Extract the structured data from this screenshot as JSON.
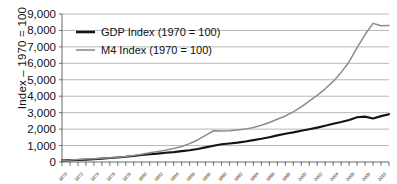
{
  "chart_data": {
    "type": "line",
    "title": "",
    "xlabel": "",
    "ylabel": "Index – 1970 = 100",
    "ylim": [
      0,
      9000
    ],
    "xlim": [
      1970,
      2011
    ],
    "grid": true,
    "legend_position": "top-left",
    "y_ticks": [
      "0",
      "1,000",
      "2,000",
      "3,000",
      "4,000",
      "5,000",
      "6,000",
      "7,000",
      "8,000",
      "9,000"
    ],
    "y_tick_values": [
      0,
      1000,
      2000,
      3000,
      4000,
      5000,
      6000,
      7000,
      8000,
      9000
    ],
    "x_ticks": [
      "1970",
      "1972",
      "1974",
      "1976",
      "1978",
      "1980",
      "1982",
      "1984",
      "1986",
      "1988",
      "1990",
      "1992",
      "1994",
      "1996",
      "1998",
      "2000",
      "2002",
      "2004",
      "2006",
      "2008",
      "2010"
    ],
    "x": [
      1970,
      1971,
      1972,
      1973,
      1974,
      1975,
      1976,
      1977,
      1978,
      1979,
      1980,
      1981,
      1982,
      1983,
      1984,
      1985,
      1986,
      1987,
      1988,
      1989,
      1990,
      1991,
      1992,
      1993,
      1994,
      1995,
      1996,
      1997,
      1998,
      1999,
      2000,
      2001,
      2002,
      2003,
      2004,
      2005,
      2006,
      2007,
      2008,
      2009,
      2010,
      2011
    ],
    "series": [
      {
        "name": "GDP Index (1970 = 100)",
        "color": "#141414",
        "values": [
          100,
          112,
          126,
          146,
          166,
          205,
          240,
          275,
          315,
          370,
          430,
          470,
          510,
          560,
          600,
          660,
          715,
          790,
          890,
          990,
          1080,
          1130,
          1180,
          1250,
          1330,
          1410,
          1510,
          1620,
          1720,
          1800,
          1900,
          1990,
          2090,
          2200,
          2320,
          2430,
          2560,
          2720,
          2760,
          2650,
          2790,
          2910
        ]
      },
      {
        "name": "M4 Index (1970 = 100)",
        "color": "#8c8c8c",
        "values": [
          100,
          115,
          145,
          180,
          205,
          230,
          255,
          285,
          330,
          390,
          470,
          560,
          640,
          720,
          820,
          940,
          1120,
          1340,
          1620,
          1900,
          1880,
          1900,
          1950,
          2000,
          2100,
          2230,
          2400,
          2600,
          2800,
          3050,
          3350,
          3700,
          4050,
          4450,
          4900,
          5450,
          6100,
          6950,
          7750,
          8430,
          8280,
          8300
        ]
      }
    ]
  },
  "legend": {
    "items": [
      {
        "label": "GDP Index (1970 = 100)",
        "color": "#141414"
      },
      {
        "label": "M4 Index (1970 = 100)",
        "color": "#8c8c8c"
      }
    ]
  }
}
